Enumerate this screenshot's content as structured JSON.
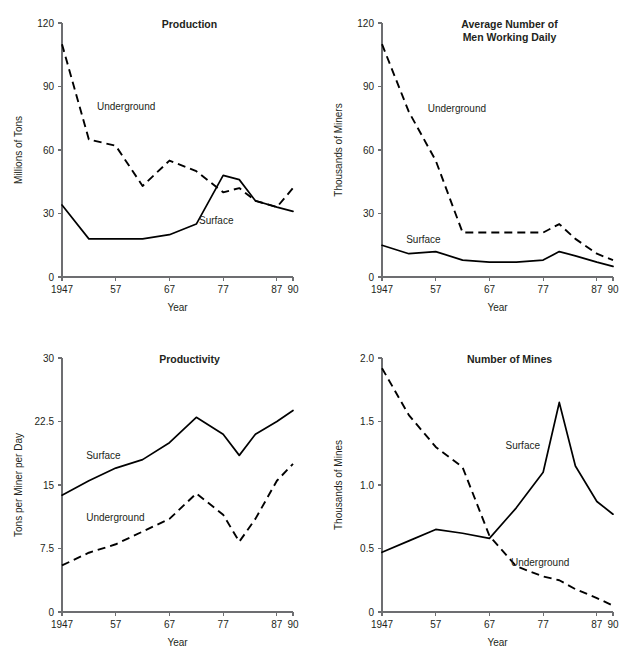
{
  "figure": {
    "background": "#ffffff",
    "line_color": "#000000",
    "axis_color": "#6d6e71",
    "text_color": "#231f20"
  },
  "charts": [
    {
      "id": "production",
      "type": "line",
      "title": "Production",
      "title_lines": [
        "Production"
      ],
      "xlabel": "Year",
      "ylabel": "Millions of Tons",
      "x": [
        1947,
        1952,
        1957,
        1962,
        1967,
        1972,
        1977,
        1980,
        1983,
        1987,
        1990
      ],
      "xtick_values": [
        1947,
        1957,
        1967,
        1977,
        1987,
        1990
      ],
      "xtick_labels": [
        "1947",
        "57",
        "67",
        "77",
        "87",
        "90"
      ],
      "ytick_values": [
        0,
        30,
        60,
        90,
        120
      ],
      "ytick_labels": [
        "0",
        "30",
        "60",
        "90",
        "120"
      ],
      "xlim": [
        1947,
        1990
      ],
      "ylim": [
        0,
        120
      ],
      "grid": false,
      "legend": "inline-labels",
      "series": [
        {
          "name": "Underground",
          "style": "dashed",
          "label_x": 1953.5,
          "label_y": 79,
          "values": [
            110,
            65,
            62,
            43,
            55,
            50,
            40,
            42,
            36,
            33,
            42
          ]
        },
        {
          "name": "Surface",
          "style": "solid",
          "label_x": 1972.5,
          "label_y": 25,
          "values": [
            34,
            18,
            18,
            18,
            20,
            25,
            48,
            46,
            36,
            33,
            31
          ]
        }
      ]
    },
    {
      "id": "men-working-daily",
      "type": "line",
      "title": "Average Number of Men Working Daily",
      "title_lines": [
        "Average Number of",
        "Men Working Daily"
      ],
      "xlabel": "Year",
      "ylabel": "Thousands of Miners",
      "x": [
        1947,
        1952,
        1957,
        1962,
        1967,
        1972,
        1977,
        1980,
        1983,
        1987,
        1990
      ],
      "xtick_values": [
        1947,
        1957,
        1967,
        1977,
        1987,
        1990
      ],
      "xtick_labels": [
        "1947",
        "57",
        "67",
        "77",
        "87",
        "90"
      ],
      "ytick_values": [
        0,
        30,
        60,
        90,
        120
      ],
      "ytick_labels": [
        "0",
        "30",
        "60",
        "90",
        "120"
      ],
      "xlim": [
        1947,
        1990
      ],
      "ylim": [
        0,
        120
      ],
      "grid": false,
      "legend": "inline-labels",
      "series": [
        {
          "name": "Underground",
          "style": "dashed",
          "label_x": 1955.5,
          "label_y": 78,
          "values": [
            110,
            78,
            55,
            21,
            21,
            21,
            21,
            25,
            18,
            11,
            8
          ]
        },
        {
          "name": "Surface",
          "style": "solid",
          "label_x": 1951.5,
          "label_y": 16,
          "values": [
            15,
            11,
            12,
            8,
            7,
            7,
            8,
            12,
            10,
            7,
            5
          ]
        }
      ]
    },
    {
      "id": "productivity",
      "type": "line",
      "title": "Productivity",
      "title_lines": [
        "Productivity"
      ],
      "xlabel": "Year",
      "ylabel": "Tons per Miner per Day",
      "x": [
        1947,
        1952,
        1957,
        1962,
        1967,
        1972,
        1977,
        1980,
        1983,
        1987,
        1990
      ],
      "xtick_values": [
        1947,
        1957,
        1967,
        1977,
        1987,
        1990
      ],
      "xtick_labels": [
        "1947",
        "57",
        "67",
        "77",
        "87",
        "90"
      ],
      "ytick_values": [
        0,
        7.5,
        15,
        22.5,
        30
      ],
      "ytick_labels": [
        "0",
        "7.5",
        "15",
        "22.5",
        "30"
      ],
      "xlim": [
        1947,
        1990
      ],
      "ylim": [
        0,
        30
      ],
      "grid": false,
      "legend": "inline-labels",
      "series": [
        {
          "name": "Surface",
          "style": "solid",
          "label_x": 1951.5,
          "label_y": 18.1,
          "values": [
            13.8,
            15.5,
            17.0,
            18.0,
            20.0,
            23.0,
            21.0,
            18.5,
            21.0,
            22.5,
            23.8
          ]
        },
        {
          "name": "Underground",
          "style": "dashed",
          "label_x": 1951.5,
          "label_y": 10.8,
          "values": [
            5.5,
            7.0,
            8.0,
            9.5,
            11.0,
            14.0,
            11.5,
            8.3,
            11.0,
            15.5,
            17.5
          ]
        }
      ]
    },
    {
      "id": "number-of-mines",
      "type": "line",
      "title": "Number of Mines",
      "title_lines": [
        "Number of Mines"
      ],
      "xlabel": "Year",
      "ylabel": "Thousands of Mines",
      "x": [
        1947,
        1952,
        1957,
        1962,
        1967,
        1972,
        1977,
        1980,
        1983,
        1987,
        1990
      ],
      "xtick_values": [
        1947,
        1957,
        1967,
        1977,
        1987,
        1990
      ],
      "xtick_labels": [
        "1947",
        "57",
        "67",
        "77",
        "87",
        "90"
      ],
      "ytick_values": [
        0,
        0.5,
        1.0,
        1.5,
        2.0
      ],
      "ytick_labels": [
        "0",
        "0.5",
        "1.0",
        "1.5",
        "2.0"
      ],
      "xlim": [
        1947,
        1990
      ],
      "ylim": [
        0,
        2.0
      ],
      "grid": false,
      "legend": "inline-labels",
      "series": [
        {
          "name": "Surface",
          "style": "solid",
          "label_x": 1970.0,
          "label_y": 1.28,
          "values": [
            0.47,
            0.56,
            0.65,
            0.62,
            0.58,
            0.82,
            1.1,
            1.65,
            1.15,
            0.87,
            0.77
          ]
        },
        {
          "name": "Underground",
          "style": "dashed",
          "label_x": 1971.0,
          "label_y": 0.36,
          "values": [
            1.92,
            1.55,
            1.3,
            1.14,
            0.6,
            0.36,
            0.28,
            0.25,
            0.18,
            0.11,
            0.05
          ]
        }
      ]
    }
  ],
  "chart_data": [
    {
      "type": "line",
      "title": "Production",
      "xlabel": "Year",
      "ylabel": "Millions of Tons",
      "x": [
        1947,
        1952,
        1957,
        1962,
        1967,
        1972,
        1977,
        1980,
        1983,
        1987,
        1990
      ],
      "xtick_labels": [
        "1947",
        "57",
        "67",
        "77",
        "87",
        "90"
      ],
      "ytick_labels": [
        "0",
        "30",
        "60",
        "90",
        "120"
      ],
      "xlim": [
        1947,
        1990
      ],
      "ylim": [
        0,
        120
      ],
      "grid": false,
      "legend": "inline-labels",
      "series": [
        {
          "name": "Underground",
          "values": [
            110,
            65,
            62,
            43,
            55,
            50,
            40,
            42,
            36,
            33,
            42
          ]
        },
        {
          "name": "Surface",
          "values": [
            34,
            18,
            18,
            18,
            20,
            25,
            48,
            46,
            36,
            33,
            31
          ]
        }
      ]
    },
    {
      "type": "line",
      "title": "Average Number of Men Working Daily",
      "xlabel": "Year",
      "ylabel": "Thousands of Miners",
      "x": [
        1947,
        1952,
        1957,
        1962,
        1967,
        1972,
        1977,
        1980,
        1983,
        1987,
        1990
      ],
      "xtick_labels": [
        "1947",
        "57",
        "67",
        "77",
        "87",
        "90"
      ],
      "ytick_labels": [
        "0",
        "30",
        "60",
        "90",
        "120"
      ],
      "xlim": [
        1947,
        1990
      ],
      "ylim": [
        0,
        120
      ],
      "grid": false,
      "legend": "inline-labels",
      "series": [
        {
          "name": "Underground",
          "values": [
            110,
            78,
            55,
            21,
            21,
            21,
            21,
            25,
            18,
            11,
            8
          ]
        },
        {
          "name": "Surface",
          "values": [
            15,
            11,
            12,
            8,
            7,
            7,
            8,
            12,
            10,
            7,
            5
          ]
        }
      ]
    },
    {
      "type": "line",
      "title": "Productivity",
      "xlabel": "Year",
      "ylabel": "Tons per Miner per Day",
      "x": [
        1947,
        1952,
        1957,
        1962,
        1967,
        1972,
        1977,
        1980,
        1983,
        1987,
        1990
      ],
      "xtick_labels": [
        "1947",
        "57",
        "67",
        "77",
        "87",
        "90"
      ],
      "ytick_labels": [
        "0",
        "7.5",
        "15",
        "22.5",
        "30"
      ],
      "xlim": [
        1947,
        1990
      ],
      "ylim": [
        0,
        30
      ],
      "grid": false,
      "legend": "inline-labels",
      "series": [
        {
          "name": "Surface",
          "values": [
            13.8,
            15.5,
            17.0,
            18.0,
            20.0,
            23.0,
            21.0,
            18.5,
            21.0,
            22.5,
            23.8
          ]
        },
        {
          "name": "Underground",
          "values": [
            5.5,
            7.0,
            8.0,
            9.5,
            11.0,
            14.0,
            11.5,
            8.3,
            11.0,
            15.5,
            17.5
          ]
        }
      ]
    },
    {
      "type": "line",
      "title": "Number of Mines",
      "xlabel": "Year",
      "ylabel": "Thousands of Mines",
      "x": [
        1947,
        1952,
        1957,
        1962,
        1967,
        1972,
        1977,
        1980,
        1983,
        1987,
        1990
      ],
      "xtick_labels": [
        "1947",
        "57",
        "67",
        "77",
        "87",
        "90"
      ],
      "ytick_labels": [
        "0",
        "0.5",
        "1.0",
        "1.5",
        "2.0"
      ],
      "xlim": [
        1947,
        2.0
      ],
      "ylim": [
        0,
        2.0
      ],
      "grid": false,
      "legend": "inline-labels",
      "series": [
        {
          "name": "Surface",
          "values": [
            0.47,
            0.56,
            0.65,
            0.62,
            0.58,
            0.82,
            1.1,
            1.65,
            1.15,
            0.87,
            0.77
          ]
        },
        {
          "name": "Underground",
          "values": [
            1.92,
            1.55,
            1.3,
            1.14,
            0.6,
            0.36,
            0.28,
            0.25,
            0.18,
            0.11,
            0.05
          ]
        }
      ]
    }
  ]
}
